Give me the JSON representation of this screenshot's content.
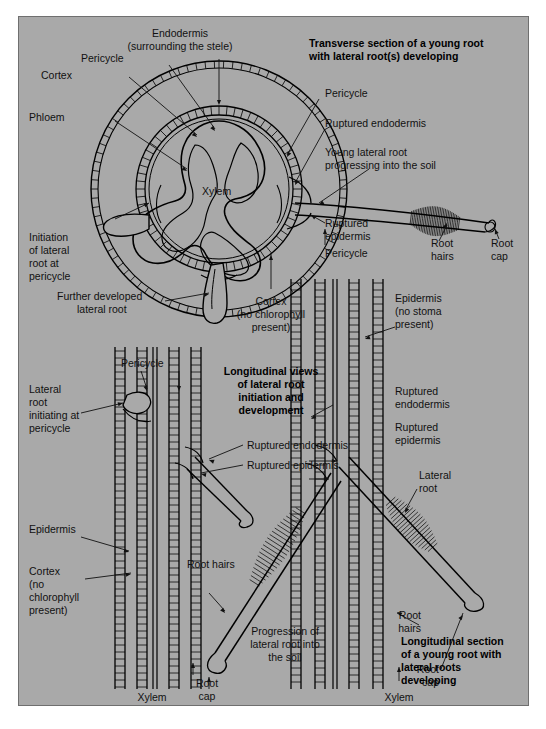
{
  "figure": {
    "background_color": "#a9a9a9",
    "border_color": "#6f6f6f",
    "ink_color": "#111111"
  },
  "headings": {
    "transverse": "Transverse section of a young root\nwith lateral root(s) developing",
    "transverse_line1": "Transverse section of a young root",
    "transverse_line2": "with lateral root(s) developing",
    "longitudinal_views_line1": "Longitudinal views",
    "longitudinal_views_line2": "of lateral root",
    "longitudinal_views_line3": "initiation and",
    "longitudinal_views_line4": "development",
    "longitudinal_section_line1": "Longitudinal section",
    "longitudinal_section_line2": "of a young root with",
    "longitudinal_section_line3": "lateral roots",
    "longitudinal_section_line4": "developing"
  },
  "transverse_labels": {
    "endodermis_l1": "Endodermis",
    "endodermis_l2": "(surrounding the stele)",
    "pericycle_left": "Pericycle",
    "cortex": "Cortex",
    "phloem": "Phloem",
    "xylem": "Xylem",
    "pericycle_right": "Pericycle",
    "ruptured_endodermis": "Ruptured endodermis",
    "young_lateral_l1": "Young lateral root",
    "young_lateral_l2": "progressing into the soil",
    "ruptured_epidermis_l1": "Ruptured",
    "ruptured_epidermis_l2": "epidermis",
    "pericycle_right2": "Pericycle",
    "root_hairs_l1": "Root",
    "root_hairs_l2": "hairs",
    "root_cap_l1": "Root",
    "root_cap_l2": "cap",
    "initiation_l1": "Initiation",
    "initiation_l2": "of lateral",
    "initiation_l3": "root at",
    "initiation_l4": "pericycle",
    "further_dev_l1": "Further developed",
    "further_dev_l2": "lateral root",
    "cortex_no_chl_l1": "Cortex",
    "cortex_no_chl_l2": "(no chlorophyll",
    "cortex_no_chl_l3": "present)"
  },
  "longitudinal_labels": {
    "pericycle": "Pericycle",
    "lateral_root_init_l1": "Lateral",
    "lateral_root_init_l2": "root",
    "lateral_root_init_l3": "initiating at",
    "lateral_root_init_l4": "pericycle",
    "epidermis_no_stoma_l1": "Epidermis",
    "epidermis_no_stoma_l2": "(no stoma",
    "epidermis_no_stoma_l3": "present)",
    "ruptured_endodermis_r_l1": "Ruptured",
    "ruptured_endodermis_r_l2": "endodermis",
    "ruptured_epidermis_r_l1": "Ruptured",
    "ruptured_epidermis_r_l2": "epidermis",
    "ruptured_endodermis_mid": "Ruptured endodermis",
    "ruptured_epidermis_mid": "Ruptured epidermis",
    "lateral_root_l1": "Lateral",
    "lateral_root_l2": "root",
    "epidermis": "Epidermis",
    "cortex_l1": "Cortex",
    "cortex_l2": "(no",
    "cortex_l3": "chlorophyll",
    "cortex_l4": "present)",
    "root_hairs_mid": "Root hairs",
    "root_hairs_r_l1": "Root",
    "root_hairs_r_l2": "hairs",
    "progression_l1": "Progression of",
    "progression_l2": "lateral root into",
    "progression_l3": "the soil",
    "root_cap_mid_l1": "Root",
    "root_cap_mid_l2": "cap",
    "root_cap_r_l1": "Root",
    "root_cap_r_l2": "cap",
    "xylem_left": "Xylem",
    "xylem_right": "Xylem"
  },
  "caption": {
    "text": ""
  }
}
